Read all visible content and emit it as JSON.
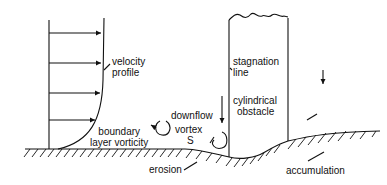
{
  "diagram": {
    "labels": {
      "velocity_profile": [
        "velocity",
        "profile"
      ],
      "stagnation_line": [
        "stagnation",
        "line"
      ],
      "cylindrical_obstacle": [
        "cylindrical",
        "obstacle"
      ],
      "downflow": "downflow",
      "vortex": "vortex",
      "vortex_symbol": "S",
      "boundary_layer_vorticity": [
        "boundary",
        "layer vorticity"
      ],
      "erosion": "erosion",
      "accumulation": "accumulation"
    },
    "colors": {
      "ink": "#111111",
      "background": "#ffffff"
    }
  }
}
